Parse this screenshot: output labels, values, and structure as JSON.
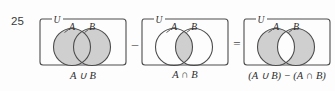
{
  "figure": {
    "exercise_number": "25",
    "background_color": "#fdfdfd",
    "shade_color": "#cfcfcf",
    "stroke_color": "#4d4d4d",
    "universe_label": "U",
    "set_a_label": "A",
    "set_b_label": "B",
    "panels": [
      {
        "id": "union",
        "caption": "A ∪ B",
        "shaded_regions": [
          "A only",
          "intersection",
          "B only"
        ],
        "universe_label": "U",
        "set_a_label": "A",
        "set_b_label": "B"
      },
      {
        "id": "intersection",
        "caption": "A ∩ B",
        "shaded_regions": [
          "intersection"
        ],
        "universe_label": "U",
        "set_a_label": "A",
        "set_b_label": "B"
      },
      {
        "id": "symmetric-difference",
        "caption": "(A ∪ B) − (A ∩ B)",
        "shaded_regions": [
          "A only",
          "B only"
        ],
        "universe_label": "U",
        "set_a_label": "A",
        "set_b_label": "B"
      }
    ],
    "operators": [
      {
        "id": "minus",
        "symbol": "–"
      },
      {
        "id": "equals",
        "symbol": "="
      }
    ]
  }
}
